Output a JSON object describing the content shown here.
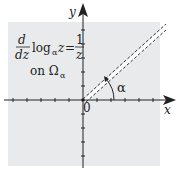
{
  "diagram": {
    "formula": {
      "d": "d",
      "dz": "dz",
      "log": "log",
      "subscript": "α",
      "arg": "z",
      "equals": "=",
      "numerator": "1",
      "denominator": "z"
    },
    "domain_label": "on Ω",
    "domain_subscript": "α",
    "x_label": "x",
    "y_label": "y",
    "origin_label": "0",
    "angle_label": "α",
    "colors": {
      "region": "#e8eaec",
      "axis": "#222222"
    }
  }
}
